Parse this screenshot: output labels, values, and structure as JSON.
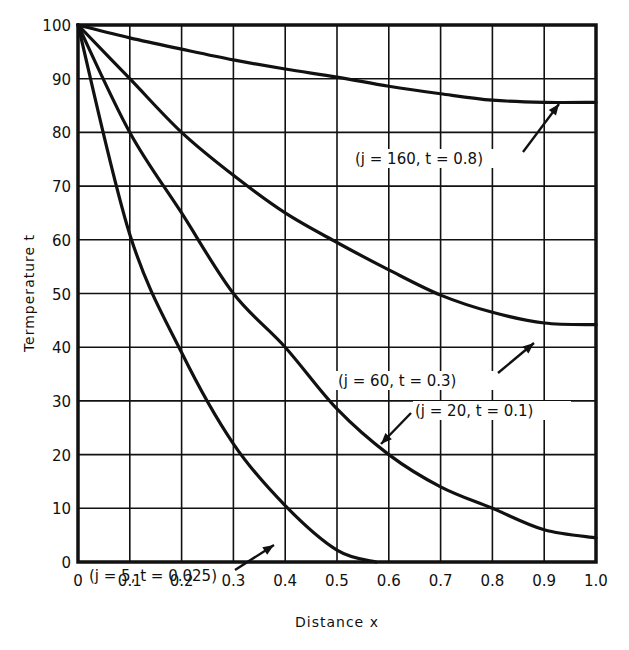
{
  "chart_data": {
    "type": "line",
    "title": "",
    "xlabel": "Distance x",
    "ylabel": "Termperature t",
    "xlim": [
      0,
      1.0
    ],
    "ylim": [
      0,
      100
    ],
    "grid": true,
    "x_ticks": [
      "0",
      "0.1",
      "0.2",
      "0.3",
      "0.4",
      "0.5",
      "0.6",
      "0.7",
      "0.8",
      "0.9",
      "1.0"
    ],
    "y_ticks": [
      "0",
      "10",
      "20",
      "30",
      "40",
      "50",
      "60",
      "70",
      "80",
      "90",
      "100"
    ],
    "x": [
      0,
      0.1,
      0.2,
      0.3,
      0.4,
      0.5,
      0.6,
      0.7,
      0.8,
      0.9,
      1.0
    ],
    "series": [
      {
        "name": "(j = 160, t = 0.8)",
        "values": [
          100,
          97.6,
          95.5,
          93.5,
          91.8,
          90.3,
          88.6,
          87.2,
          86.0,
          85.6,
          85.6
        ]
      },
      {
        "name": "(j = 60, t = 0.3)",
        "values": [
          100,
          90,
          80,
          72,
          65,
          59.5,
          54.4,
          49.7,
          46.5,
          44.5,
          44.2
        ]
      },
      {
        "name": "(j = 20, t = 0.1)",
        "values": [
          100,
          80,
          65,
          50,
          40,
          28.5,
          20,
          14,
          10,
          6,
          4.5
        ]
      },
      {
        "name": "(j = 5, t = 0.025)",
        "values": [
          100,
          61,
          39,
          22,
          10.5,
          2.2,
          0,
          null,
          null,
          null,
          null
        ]
      }
    ],
    "annotations": [
      {
        "text": "(j = 160, t = 0.8)",
        "points_to": [
          0.93,
          85.7
        ]
      },
      {
        "text": "(j = 60, t = 0.3)",
        "points_to": [
          0.88,
          44.8
        ]
      },
      {
        "text": "(j = 20, t = 0.1)",
        "points_to": [
          0.58,
          21.5
        ]
      },
      {
        "text": "(j = 5, t = 0.025)",
        "points_to": [
          0.38,
          12
        ]
      }
    ]
  }
}
